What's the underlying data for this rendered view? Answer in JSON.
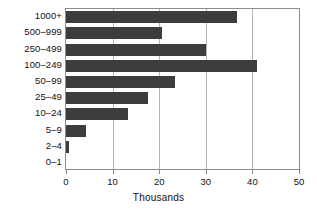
{
  "chart_data": {
    "type": "bar",
    "orientation": "horizontal",
    "title": "",
    "xlabel": "Thousands",
    "ylabel": "",
    "categories": [
      "1000+",
      "500–999",
      "250–499",
      "100–249",
      "50–99",
      "25–49",
      "10–24",
      "5–9",
      "2–4",
      "0–1"
    ],
    "values": [
      36.8,
      20.6,
      30.0,
      40.9,
      23.3,
      17.6,
      13.3,
      4.3,
      0.6,
      0.0
    ],
    "xlim": [
      0,
      50
    ],
    "xticks": [
      0,
      10,
      20,
      30,
      40,
      50
    ],
    "xtick_labels": [
      "0",
      "10",
      "20",
      "30",
      "40",
      "50"
    ],
    "grid": "vertical",
    "legend": "none",
    "bar_color": "#3d3d3d",
    "frame_color": "#8c8c8c",
    "gridline_color": "#b4b4b4"
  }
}
